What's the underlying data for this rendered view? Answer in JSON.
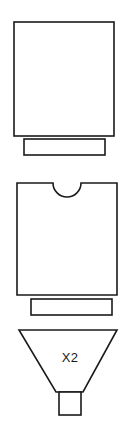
{
  "canvas": {
    "width": 134,
    "height": 433,
    "background_color": "#ffffff",
    "stroke_color": "#1a1a1a",
    "fill_color": "#ffffff",
    "stroke_width": 1.6
  },
  "diagram": {
    "type": "line-drawing",
    "parts": [
      {
        "id": "part-1",
        "name": "plain-block-with-base",
        "label": "",
        "shape": "rectangle-with-foot",
        "body": {
          "shape": "rectangle",
          "x": 14,
          "y": 22,
          "width": 100,
          "height": 114
        },
        "foot": {
          "shape": "rectangle",
          "x": 24,
          "y": 139,
          "width": 81,
          "height": 16
        }
      },
      {
        "id": "part-2",
        "name": "notched-block-with-base",
        "label": "",
        "shape": "rectangle-with-semicircular-top-notch-and-foot",
        "body": {
          "shape": "rectangle",
          "x": 17,
          "y": 183,
          "width": 100,
          "height": 112
        },
        "notch": {
          "shape": "semicircle",
          "center_x": 67,
          "center_y": 183,
          "radius": 14,
          "opens": "upward"
        },
        "foot": {
          "shape": "rectangle",
          "x": 31,
          "y": 299,
          "width": 81,
          "height": 16
        }
      },
      {
        "id": "part-3",
        "name": "funnel-hopper-with-spout",
        "label": "X2",
        "shape": "inverted-trapezoid-with-spout",
        "body": {
          "shape": "trapezoid",
          "top_left_x": 19,
          "top_right_x": 117,
          "top_y": 330,
          "bottom_left_x": 56,
          "bottom_right_x": 83,
          "bottom_y": 392
        },
        "spout": {
          "shape": "rectangle",
          "x": 59,
          "y": 392,
          "width": 22,
          "height": 23
        },
        "label_position": {
          "x": 70,
          "y": 358
        }
      }
    ]
  }
}
